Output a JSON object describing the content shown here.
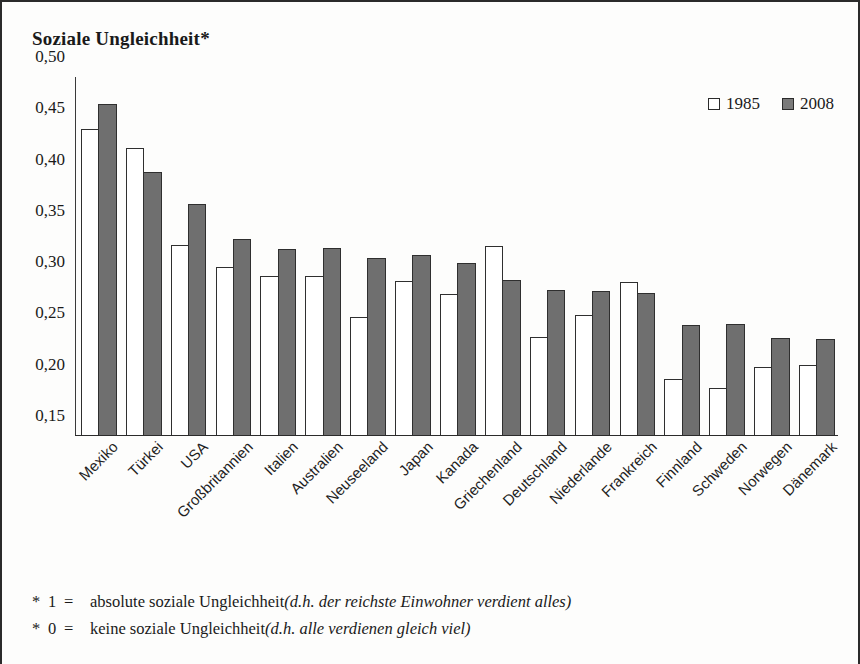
{
  "title": "Soziale Ungleichheit*",
  "legend": {
    "position": "top-right",
    "entries": [
      {
        "label": "1985",
        "color": "#ffffff",
        "icon": "square-outline-icon"
      },
      {
        "label": "2008",
        "color": "#6f6f6f",
        "icon": "square-filled-icon"
      }
    ]
  },
  "footnotes": [
    {
      "star": "*",
      "num": "1",
      "eq": "=",
      "text": "absolute soziale Ungleichheit ",
      "italic": "(d.h. der reichste Einwohner verdient alles)"
    },
    {
      "star": "*",
      "num": "0",
      "eq": "=",
      "text": "keine soziale Ungleichheit ",
      "italic": "(d.h. alle verdienen gleich viel)"
    }
  ],
  "chart_data": {
    "type": "bar",
    "title": "Soziale Ungleichheit*",
    "xlabel": "",
    "ylabel": "",
    "ylim": [
      0.15,
      0.5
    ],
    "ytick_labels": [
      "0,50",
      "0,45",
      "0,40",
      "0,35",
      "0,30",
      "0,25",
      "0,20",
      "0,15"
    ],
    "ytick_values": [
      0.5,
      0.45,
      0.4,
      0.35,
      0.3,
      0.25,
      0.2,
      0.15
    ],
    "grid": false,
    "categories": [
      "Mexiko",
      "Türkei",
      "USA",
      "Großbritannien",
      "Italien",
      "Australien",
      "Neuseeland",
      "Japan",
      "Kanada",
      "Griechenland",
      "Deutschland",
      "Niederlande",
      "Frankreich",
      "Finnland",
      "Schweden",
      "Norwegen",
      "Dänemark"
    ],
    "series": [
      {
        "name": "1985",
        "color": "#ffffff",
        "values": [
          0.449,
          0.431,
          0.336,
          0.315,
          0.306,
          0.306,
          0.266,
          0.301,
          0.288,
          0.335,
          0.247,
          0.268,
          0.3,
          0.206,
          0.197,
          0.217,
          0.219
        ]
      },
      {
        "name": "2008",
        "color": "#6f6f6f",
        "values": [
          0.474,
          0.407,
          0.376,
          0.342,
          0.332,
          0.333,
          0.324,
          0.326,
          0.319,
          0.302,
          0.292,
          0.291,
          0.289,
          0.258,
          0.259,
          0.246,
          0.245
        ]
      }
    ]
  }
}
